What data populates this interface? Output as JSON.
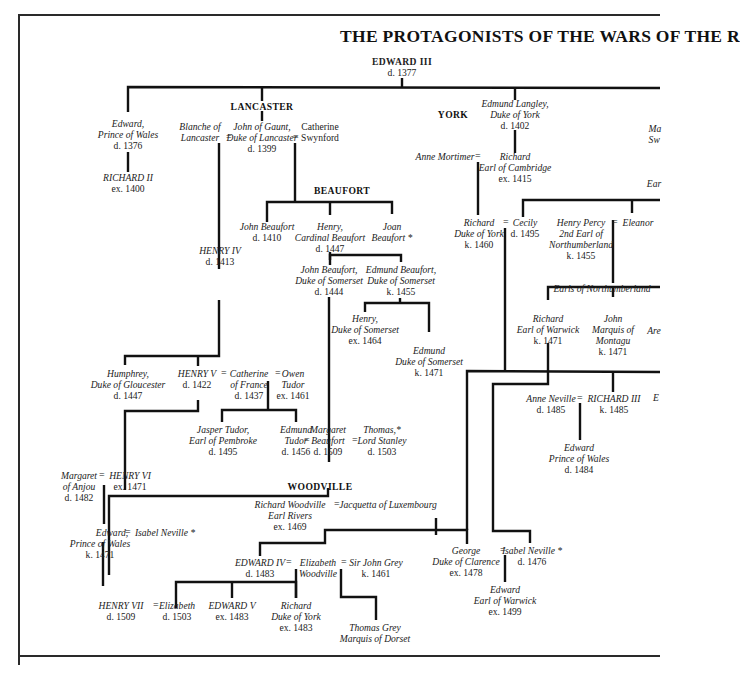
{
  "title": "THE PROTAGONISTS OF THE WARS OF THE R",
  "houses": {
    "lancaster": "LANCASTER",
    "york": "YORK",
    "beaufort": "BEAUFORT",
    "woodville": "WOODVILLE"
  },
  "people": {
    "edward_iii": {
      "name": "EDWARD III",
      "date": "d. 1377"
    },
    "edward_black_prince": {
      "name1": "Edward,",
      "name2": "Prince of Wales",
      "date": "d. 1376"
    },
    "richard_ii": {
      "name": "RICHARD II",
      "date": "ex. 1400"
    },
    "blanche": {
      "name1": "Blanche of",
      "name2": "Lancaster"
    },
    "john_of_gaunt": {
      "name1": "John of Gaunt,",
      "name2": "Duke of Lancaster",
      "date": "d. 1399"
    },
    "catherine_swynford": {
      "name1": "Catherine",
      "name2": "Swynford"
    },
    "edmund_langley": {
      "name1": "Edmund Langley,",
      "name2": "Duke of York",
      "date": "d. 1402"
    },
    "anne_mortimer": {
      "name": "Anne Mortimer"
    },
    "richard_cambridge": {
      "name1": "Richard",
      "name2": "Earl of Cambridge",
      "date": "ex. 1415"
    },
    "henry_iv": {
      "name": "HENRY IV",
      "date": "d. 1413"
    },
    "john_beaufort": {
      "name": "John Beaufort",
      "date": "d. 1410"
    },
    "henry_cardinal": {
      "name1": "Henry,",
      "name2": "Cardinal Beaufort",
      "date": "d. 1447"
    },
    "joan_beaufort": {
      "name1": "Joan",
      "name2": "Beaufort *"
    },
    "john_beaufort_somerset": {
      "name1": "John Beaufort,",
      "name2": "Duke of Somerset",
      "date": "d. 1444"
    },
    "edmund_beaufort_somerset": {
      "name1": "Edmund Beaufort,",
      "name2": "Duke of Somerset",
      "date": "k. 1455"
    },
    "henry_somerset": {
      "name1": "Henry,",
      "name2": "Duke of Somerset",
      "date": "ex. 1464"
    },
    "edmund_somerset": {
      "name1": "Edmund",
      "name2": "Duke of Somerset",
      "date": "k. 1471"
    },
    "richard_york": {
      "name1": "Richard",
      "name2": "Duke of York",
      "date": "k. 1460"
    },
    "cecily": {
      "name": "Cecily",
      "date": "d. 1495"
    },
    "henry_percy": {
      "name1": "Henry Percy",
      "name2": "2nd Earl of",
      "name3": "Northumberland",
      "date": "k. 1455"
    },
    "eleanor": {
      "name": "Eleanor"
    },
    "earls_northumberland": {
      "name": "Earls of Northumberland"
    },
    "richard_warwick": {
      "name1": "Richard",
      "name2": "Earl of Warwick",
      "date": "k. 1471"
    },
    "john_montagu": {
      "name1": "John",
      "name2": "Marquis of",
      "name3": "Montagu",
      "date": "k. 1471"
    },
    "humphrey": {
      "name1": "Humphrey,",
      "name2": "Duke of Gloucester",
      "date": "d. 1447"
    },
    "henry_v": {
      "name": "HENRY V",
      "date": "d. 1422"
    },
    "catherine_france": {
      "name1": "Catherine",
      "name2": "of France",
      "date": "d. 1437"
    },
    "owen_tudor": {
      "name1": "Owen",
      "name2": "Tudor",
      "date": "ex. 1461"
    },
    "jasper_tudor": {
      "name1": "Jasper Tudor,",
      "name2": "Earl of Pembroke",
      "date": "d. 1495"
    },
    "edmund_tudor": {
      "name1": "Edmund",
      "name2": "Tudor",
      "date": "d. 1456"
    },
    "margaret_beaufort": {
      "name1": "Margaret",
      "name2": "Beaufort",
      "date": "d. 1509"
    },
    "thomas_stanley": {
      "name1": "Thomas,*",
      "name2": "Lord Stanley",
      "date": "d. 1503"
    },
    "anne_neville": {
      "name": "Anne Neville",
      "date": "d. 1485"
    },
    "richard_iii": {
      "name": "RICHARD III",
      "date": "k. 1485"
    },
    "edward_prince_1484": {
      "name1": "Edward",
      "name2": "Prince of Wales",
      "date": "d. 1484"
    },
    "margaret_anjou": {
      "name1": "Margaret",
      "name2": "of Anjou",
      "date": "d. 1482"
    },
    "henry_vi": {
      "name": "HENRY VI",
      "date": "ex. 1471"
    },
    "edward_prince_1471": {
      "name1": "Edward,",
      "name2": "Prince of Wales",
      "date": "k. 1471"
    },
    "isabel_neville_1": {
      "name": "Isabel Neville *"
    },
    "richard_woodville": {
      "name1": "Richard Woodville",
      "name2": "Earl Rivers",
      "date": "ex. 1469"
    },
    "jacquetta": {
      "name": "Jacquetta of Luxembourg"
    },
    "edward_iv": {
      "name": "EDWARD IV",
      "date": "d. 1483"
    },
    "elizabeth_woodville": {
      "name1": "Elizabeth",
      "name2": "Woodville"
    },
    "john_grey": {
      "name": "Sir John Grey",
      "date": "k. 1461"
    },
    "george_clarence": {
      "name1": "George",
      "name2": "Duke of Clarence",
      "date": "ex. 1478"
    },
    "isabel_neville_2": {
      "name": "Isabel Neville *",
      "date": "d. 1476"
    },
    "edward_warwick": {
      "name1": "Edward",
      "name2": "Earl of Warwick",
      "date": "ex. 1499"
    },
    "henry_vii": {
      "name": "HENRY VII",
      "date": "d. 1509"
    },
    "elizabeth_york": {
      "name": "Elizabeth",
      "date": "d. 1503"
    },
    "edward_v": {
      "name": "EDWARD V",
      "date": "ex. 1483"
    },
    "richard_york_1483": {
      "name1": "Richard",
      "name2": "Duke of York",
      "date": "ex. 1483"
    },
    "thomas_grey": {
      "name1": "Thomas Grey",
      "name2": "Marquis of Dorset"
    }
  },
  "cutoff": {
    "ma": "Ma",
    "sw": "Sw",
    "ear": "Ear",
    "are": "Are",
    "e": "E"
  },
  "marriage_symbol": "="
}
